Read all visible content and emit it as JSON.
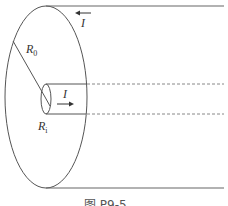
{
  "figure": {
    "caption": "图 P9-5",
    "type": "coaxial-cable-cross-section",
    "colors": {
      "stroke": "#555555",
      "dashed": "#888888",
      "text": "#333333",
      "background": "#ffffff"
    }
  },
  "labels": {
    "outer_radius": {
      "symbol": "R",
      "subscript": "0"
    },
    "inner_radius": {
      "symbol": "R",
      "subscript": "i"
    },
    "outer_current": {
      "symbol": "I",
      "direction": "left"
    },
    "inner_current": {
      "symbol": "I",
      "direction": "right"
    }
  }
}
